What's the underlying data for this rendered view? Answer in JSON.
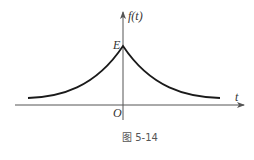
{
  "figure": {
    "caption": "图 5-14",
    "y_axis_label": "f(t)",
    "x_axis_label": "t",
    "origin_label": "O",
    "peak_label": "E"
  },
  "colors": {
    "axis": "#555555",
    "curve": "#1a1a1a"
  }
}
